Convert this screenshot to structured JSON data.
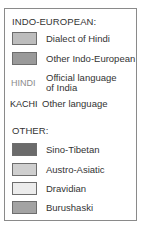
{
  "legend": {
    "indo_european": {
      "heading": "INDO-EUROPEAN:",
      "items": [
        {
          "label": "Dialect of Hindi",
          "color": "#bdbdbd"
        },
        {
          "label": "Other Indo-European",
          "color": "#9a9a9a"
        }
      ],
      "text_styles": [
        {
          "sample": "HINDI",
          "sample_color": "#8c8c8c",
          "label_line1": "Official language",
          "label_line2": "of India"
        },
        {
          "sample": "KACHI",
          "sample_color": "#2a2a2a",
          "label_line1": "Other language"
        }
      ]
    },
    "other": {
      "heading": "OTHER:",
      "items": [
        {
          "label": "Sino-Tibetan",
          "color": "#6b6b6b"
        },
        {
          "label": "Austro-Asiatic",
          "color": "#cfcfcf"
        },
        {
          "label": "Dravidian",
          "color": "#ececec"
        },
        {
          "label": "Burushaski",
          "color": "#a3a3a3"
        }
      ]
    }
  }
}
